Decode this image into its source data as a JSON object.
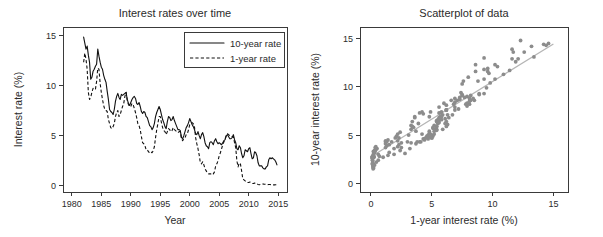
{
  "figure": {
    "width": 603,
    "height": 237,
    "background": "#ffffff",
    "series_color": "#111111",
    "point_color": "#8c8c8c",
    "fitline_color": "#b5b5b5"
  },
  "chart_data": [
    {
      "type": "line",
      "panel": "left",
      "title": "Interest rates over time",
      "xlabel": "Year",
      "ylabel": "Interest rate (%)",
      "xlim": [
        1978.5,
        2016.5
      ],
      "ylim": [
        -0.6,
        15.8
      ],
      "xticks": [
        1980,
        1985,
        1990,
        1995,
        2000,
        2005,
        2010,
        2015
      ],
      "yticks": [
        0,
        5,
        10,
        15
      ],
      "grid": false,
      "legend": {
        "position": "top-right",
        "entries": [
          {
            "label": "10-year rate",
            "style": "solid"
          },
          {
            "label": "1-year rate",
            "style": "dashed"
          }
        ]
      },
      "x": [
        1982.0,
        1982.2,
        1982.4,
        1982.6,
        1982.8,
        1983.0,
        1983.2,
        1983.4,
        1983.6,
        1983.8,
        1984.0,
        1984.2,
        1984.4,
        1984.6,
        1984.8,
        1985.0,
        1985.2,
        1985.4,
        1985.6,
        1985.8,
        1986.0,
        1986.2,
        1986.4,
        1986.6,
        1986.8,
        1987.0,
        1987.2,
        1987.4,
        1987.6,
        1987.8,
        1988.0,
        1988.2,
        1988.4,
        1988.6,
        1988.8,
        1989.0,
        1989.2,
        1989.4,
        1989.6,
        1989.8,
        1990.0,
        1990.2,
        1990.4,
        1990.6,
        1990.8,
        1991.0,
        1991.2,
        1991.4,
        1991.6,
        1991.8,
        1992.0,
        1992.2,
        1992.4,
        1992.6,
        1992.8,
        1993.0,
        1993.2,
        1993.4,
        1993.6,
        1993.8,
        1994.0,
        1994.2,
        1994.4,
        1994.6,
        1994.8,
        1995.0,
        1995.2,
        1995.4,
        1995.6,
        1995.8,
        1996.0,
        1996.2,
        1996.4,
        1996.6,
        1996.8,
        1997.0,
        1997.2,
        1997.4,
        1997.6,
        1997.8,
        1998.0,
        1998.2,
        1998.4,
        1998.6,
        1998.8,
        1999.0,
        1999.2,
        1999.4,
        1999.6,
        1999.8,
        2000.0,
        2000.2,
        2000.4,
        2000.6,
        2000.8,
        2001.0,
        2001.2,
        2001.4,
        2001.6,
        2001.8,
        2002.0,
        2002.2,
        2002.4,
        2002.6,
        2002.8,
        2003.0,
        2003.2,
        2003.4,
        2003.6,
        2003.8,
        2004.0,
        2004.2,
        2004.4,
        2004.6,
        2004.8,
        2005.0,
        2005.2,
        2005.4,
        2005.6,
        2005.8,
        2006.0,
        2006.2,
        2006.4,
        2006.6,
        2006.8,
        2007.0,
        2007.2,
        2007.4,
        2007.6,
        2007.8,
        2008.0,
        2008.2,
        2008.4,
        2008.6,
        2008.8,
        2009.0,
        2009.2,
        2009.4,
        2009.6,
        2009.8,
        2010.0,
        2010.2,
        2010.4,
        2010.6,
        2010.8,
        2011.0,
        2011.2,
        2011.4,
        2011.6,
        2011.8,
        2012.0,
        2012.2,
        2012.4,
        2012.6,
        2012.8,
        2013.0,
        2013.2,
        2013.4,
        2013.6,
        2013.8,
        2014.0,
        2014.2,
        2014.4,
        2014.6,
        2014.8
      ],
      "series": [
        {
          "name": "10-year rate",
          "style": "solid",
          "values": [
            14.8,
            14.2,
            13.6,
            13.9,
            13.0,
            12.3,
            10.6,
            10.8,
            11.4,
            11.6,
            11.9,
            12.1,
            13.6,
            12.9,
            12.3,
            11.8,
            11.6,
            11.0,
            10.6,
            10.3,
            9.4,
            8.6,
            7.6,
            7.4,
            7.3,
            7.1,
            7.6,
            8.4,
            8.9,
            9.2,
            8.8,
            8.6,
            9.1,
            9.0,
            9.1,
            9.2,
            9.3,
            8.6,
            8.2,
            8.0,
            8.3,
            8.6,
            8.8,
            8.9,
            8.7,
            8.2,
            8.1,
            8.3,
            7.9,
            7.4,
            7.2,
            7.4,
            7.3,
            6.9,
            6.8,
            6.4,
            6.0,
            5.9,
            5.6,
            5.8,
            6.2,
            6.9,
            7.3,
            7.6,
            7.9,
            7.6,
            7.1,
            6.6,
            6.3,
            5.9,
            5.7,
            6.4,
            6.9,
            6.8,
            6.5,
            6.6,
            6.9,
            6.5,
            6.2,
            5.9,
            5.6,
            5.6,
            5.5,
            4.8,
            4.7,
            5.0,
            5.4,
            5.8,
            6.0,
            6.3,
            6.7,
            6.4,
            6.1,
            5.9,
            5.6,
            5.2,
            5.1,
            5.4,
            5.0,
            4.7,
            5.1,
            5.3,
            4.9,
            4.3,
            4.0,
            3.9,
            3.7,
            4.3,
            4.4,
            4.3,
            4.1,
            4.5,
            4.7,
            4.4,
            4.2,
            4.3,
            4.2,
            4.1,
            4.3,
            4.5,
            4.6,
            5.0,
            5.1,
            4.9,
            4.7,
            4.7,
            4.8,
            5.1,
            4.6,
            4.3,
            3.7,
            3.6,
            4.0,
            3.8,
            3.2,
            2.8,
            3.0,
            3.6,
            3.5,
            3.4,
            3.7,
            3.8,
            3.2,
            2.7,
            2.8,
            3.4,
            3.3,
            3.0,
            2.3,
            2.0,
            2.0,
            2.0,
            1.8,
            1.7,
            1.7,
            1.9,
            2.0,
            2.6,
            2.8,
            2.7,
            2.8,
            2.7,
            2.6,
            2.4,
            2.1
          ]
        },
        {
          "name": "1-year rate",
          "style": "dashed",
          "values": [
            12.3,
            13.2,
            12.6,
            11.6,
            9.3,
            8.6,
            8.8,
            9.3,
            9.7,
            9.6,
            9.6,
            10.4,
            11.7,
            11.6,
            10.2,
            9.3,
            8.6,
            8.0,
            7.6,
            7.5,
            7.4,
            6.6,
            6.2,
            5.8,
            5.7,
            5.9,
            6.2,
            6.9,
            7.3,
            7.5,
            6.9,
            7.1,
            7.5,
            7.9,
            8.2,
            8.9,
            9.3,
            8.5,
            8.1,
            7.9,
            7.9,
            8.2,
            8.1,
            7.7,
            7.3,
            6.8,
            6.2,
            6.0,
            5.6,
            4.9,
            4.3,
            4.2,
            4.0,
            3.6,
            3.6,
            3.4,
            3.3,
            3.4,
            3.3,
            3.5,
            3.9,
            4.8,
            5.6,
            6.2,
            6.9,
            6.9,
            6.3,
            5.8,
            5.5,
            5.4,
            5.1,
            5.4,
            5.7,
            5.6,
            5.4,
            5.5,
            5.8,
            5.6,
            5.5,
            5.4,
            5.3,
            5.4,
            5.4,
            4.7,
            4.5,
            4.7,
            4.8,
            5.1,
            5.2,
            5.6,
            6.1,
            6.2,
            6.3,
            6.2,
            5.9,
            4.8,
            4.2,
            3.7,
            3.1,
            2.3,
            2.2,
            2.4,
            2.1,
            1.7,
            1.5,
            1.3,
            1.2,
            1.2,
            1.2,
            1.3,
            1.2,
            1.4,
            2.0,
            2.2,
            2.5,
            3.0,
            3.3,
            3.7,
            4.1,
            4.4,
            4.7,
            5.0,
            5.2,
            5.1,
            5.0,
            5.0,
            4.9,
            4.9,
            4.3,
            3.8,
            2.5,
            1.9,
            2.3,
            2.2,
            1.5,
            0.7,
            0.6,
            0.5,
            0.4,
            0.35,
            0.35,
            0.4,
            0.3,
            0.25,
            0.25,
            0.3,
            0.2,
            0.2,
            0.15,
            0.12,
            0.15,
            0.2,
            0.2,
            0.18,
            0.17,
            0.15,
            0.13,
            0.15,
            0.14,
            0.13,
            0.12,
            0.11,
            0.11,
            0.12,
            0.13
          ]
        }
      ]
    },
    {
      "type": "scatter",
      "panel": "right",
      "title": "Scatterplot of data",
      "xlabel": "1-year interest rate (%)",
      "ylabel": "10-year interest rate (%)",
      "xlim": [
        -0.9,
        16.2
      ],
      "ylim": [
        -0.9,
        16.2
      ],
      "xticks": [
        0,
        5,
        10,
        15
      ],
      "yticks": [
        0,
        5,
        10,
        15
      ],
      "grid": false,
      "point_radius": 1.9,
      "fit_line": {
        "x": [
          0.0,
          15.0
        ],
        "y": [
          2.75,
          14.45
        ]
      },
      "points_x": [
        12.3,
        13.2,
        12.6,
        11.6,
        9.3,
        8.6,
        8.8,
        9.3,
        9.7,
        9.6,
        9.6,
        10.4,
        11.7,
        11.6,
        10.2,
        9.3,
        8.6,
        8.0,
        7.6,
        7.5,
        7.4,
        6.6,
        6.2,
        5.8,
        5.7,
        5.9,
        6.2,
        6.9,
        7.3,
        7.5,
        6.9,
        7.1,
        7.5,
        7.9,
        8.2,
        8.9,
        9.3,
        8.5,
        8.1,
        7.9,
        7.9,
        8.2,
        8.1,
        7.7,
        7.3,
        6.8,
        6.2,
        6.0,
        5.6,
        4.9,
        4.3,
        4.2,
        4.0,
        3.6,
        3.6,
        3.4,
        3.3,
        3.4,
        3.3,
        3.5,
        3.9,
        4.8,
        5.6,
        6.2,
        6.9,
        6.9,
        6.3,
        5.8,
        5.5,
        5.4,
        5.1,
        5.4,
        5.7,
        5.6,
        5.4,
        5.5,
        5.8,
        5.6,
        5.5,
        5.4,
        5.3,
        5.4,
        5.4,
        4.7,
        4.5,
        4.7,
        4.8,
        5.1,
        5.2,
        5.6,
        6.1,
        6.2,
        6.3,
        6.2,
        5.9,
        4.8,
        4.2,
        3.7,
        3.1,
        2.3,
        2.2,
        2.4,
        2.1,
        1.7,
        1.5,
        1.3,
        1.2,
        1.2,
        1.2,
        1.3,
        1.2,
        1.4,
        2.0,
        2.2,
        2.5,
        3.0,
        3.3,
        3.7,
        4.1,
        4.4,
        4.7,
        5.0,
        5.2,
        5.1,
        5.0,
        5.0,
        4.9,
        4.9,
        4.3,
        3.8,
        2.5,
        1.9,
        2.3,
        2.2,
        1.5,
        0.7,
        0.6,
        0.5,
        0.4,
        0.35,
        0.35,
        0.4,
        0.3,
        0.25,
        0.25,
        0.3,
        0.2,
        0.2,
        0.15,
        0.12,
        0.15,
        0.2,
        0.2,
        0.18,
        0.17,
        0.15,
        0.13,
        0.15,
        0.14,
        0.13,
        0.12,
        0.11,
        0.11,
        0.12,
        0.13,
        14.6,
        14.2,
        14.4,
        13.4,
        11.9,
        12.1,
        11.4,
        10.9,
        10.2,
        9.8,
        9.5,
        8.9,
        8.4,
        8.1,
        7.8,
        7.2,
        6.7,
        6.4,
        6.1,
        5.2,
        4.6,
        4.4,
        4.0,
        3.2,
        2.8,
        2.4,
        1.9,
        1.4,
        1.0,
        0.6,
        0.45,
        0.3,
        0.22,
        0.18,
        0.3
      ],
      "points_y": [
        14.8,
        14.2,
        13.6,
        13.9,
        13.0,
        12.3,
        10.6,
        10.8,
        11.4,
        11.6,
        11.9,
        12.1,
        13.6,
        12.9,
        12.3,
        11.8,
        11.6,
        11.0,
        10.6,
        10.3,
        9.4,
        8.6,
        7.6,
        7.4,
        7.3,
        7.1,
        7.6,
        8.4,
        8.9,
        9.2,
        8.8,
        8.6,
        9.1,
        9.0,
        9.1,
        9.2,
        9.3,
        8.6,
        8.2,
        8.0,
        8.3,
        8.6,
        8.8,
        8.9,
        8.7,
        8.2,
        8.1,
        8.3,
        7.9,
        7.4,
        7.2,
        7.4,
        7.3,
        6.9,
        6.8,
        6.4,
        6.0,
        5.9,
        5.6,
        5.8,
        6.2,
        6.9,
        7.3,
        7.6,
        7.9,
        7.6,
        7.1,
        6.6,
        6.3,
        5.9,
        5.7,
        6.4,
        6.9,
        6.8,
        6.5,
        6.6,
        6.9,
        6.5,
        6.2,
        5.9,
        5.6,
        5.6,
        5.5,
        4.8,
        4.7,
        5.0,
        5.4,
        5.8,
        6.0,
        6.3,
        6.7,
        6.4,
        6.1,
        5.9,
        5.6,
        5.2,
        5.1,
        5.4,
        5.0,
        4.7,
        5.1,
        5.3,
        4.9,
        4.3,
        4.0,
        3.9,
        3.7,
        4.3,
        4.4,
        4.3,
        4.1,
        4.5,
        4.7,
        4.4,
        4.2,
        4.3,
        4.2,
        4.1,
        4.3,
        4.5,
        4.6,
        5.0,
        5.1,
        4.9,
        4.7,
        4.7,
        4.8,
        5.1,
        4.6,
        4.3,
        3.7,
        3.6,
        4.0,
        3.8,
        3.2,
        2.8,
        3.0,
        3.6,
        3.5,
        3.4,
        3.7,
        3.8,
        3.2,
        2.7,
        2.8,
        3.4,
        3.3,
        3.0,
        2.3,
        2.0,
        2.0,
        2.0,
        1.8,
        1.7,
        1.7,
        1.9,
        2.0,
        2.6,
        2.8,
        2.7,
        2.8,
        2.7,
        2.6,
        2.4,
        2.1,
        14.5,
        14.4,
        14.3,
        13.1,
        12.6,
        12.9,
        11.7,
        11.3,
        10.8,
        10.4,
        9.9,
        9.3,
        8.8,
        8.5,
        8.2,
        7.7,
        7.1,
        6.8,
        6.2,
        5.4,
        4.9,
        4.6,
        4.3,
        3.6,
        3.1,
        3.4,
        3.0,
        2.9,
        2.7,
        2.4,
        2.2,
        1.9,
        1.6,
        1.5,
        3.3
      ]
    }
  ]
}
